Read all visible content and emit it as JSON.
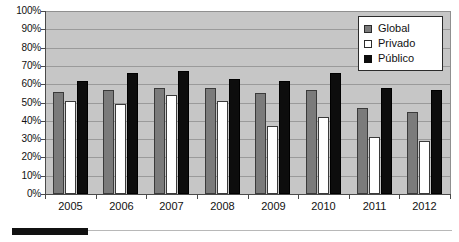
{
  "chart_data": {
    "type": "bar",
    "title": "",
    "subtitle": "",
    "xlabel": "",
    "ylabel": "",
    "categories": [
      "2005",
      "2006",
      "2007",
      "2008",
      "2009",
      "2010",
      "2011",
      "2012"
    ],
    "series": [
      {
        "name": "Global",
        "color": "#7b7b7b",
        "values": [
          56,
          57,
          58,
          58,
          55,
          57,
          47,
          45
        ]
      },
      {
        "name": "Privado",
        "color": "#ffffff",
        "values": [
          51,
          49,
          54,
          51,
          37,
          42,
          31,
          29
        ]
      },
      {
        "name": "Público",
        "color": "#0d0d0d",
        "values": [
          62,
          66,
          67,
          63,
          62,
          66,
          58,
          57
        ]
      }
    ],
    "ylim": [
      0,
      100
    ],
    "ytick_values": [
      0,
      10,
      20,
      30,
      40,
      50,
      60,
      70,
      80,
      90,
      100
    ],
    "ytick_labels": [
      "0%",
      "10%",
      "20%",
      "30%",
      "40%",
      "50%",
      "60%",
      "70%",
      "80%",
      "90%",
      "100%"
    ],
    "grid": true,
    "grid_axis": "y",
    "legend_position": "top-right",
    "plot_background": "#c6c6c6",
    "annotations": []
  },
  "legend": {
    "items": [
      {
        "label": "Global",
        "swatch": "legend-swatch-global"
      },
      {
        "label": "Privado",
        "swatch": "legend-swatch-privado"
      },
      {
        "label": "Público",
        "swatch": "legend-swatch-publico"
      }
    ]
  },
  "footer": {
    "rule": ""
  }
}
